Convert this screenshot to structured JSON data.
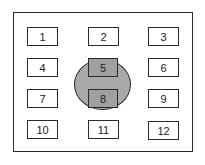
{
  "diagram": {
    "type": "grid-with-selection-ellipse",
    "rows": 4,
    "columns": 3,
    "cells": [
      {
        "label": "1",
        "row": 0,
        "col": 0,
        "highlighted": false
      },
      {
        "label": "2",
        "row": 0,
        "col": 1,
        "highlighted": false
      },
      {
        "label": "3",
        "row": 0,
        "col": 2,
        "highlighted": false
      },
      {
        "label": "4",
        "row": 1,
        "col": 0,
        "highlighted": false
      },
      {
        "label": "5",
        "row": 1,
        "col": 1,
        "highlighted": true
      },
      {
        "label": "6",
        "row": 1,
        "col": 2,
        "highlighted": false
      },
      {
        "label": "7",
        "row": 2,
        "col": 0,
        "highlighted": false
      },
      {
        "label": "8",
        "row": 2,
        "col": 1,
        "highlighted": true
      },
      {
        "label": "9",
        "row": 2,
        "col": 2,
        "highlighted": false
      },
      {
        "label": "10",
        "row": 3,
        "col": 0,
        "highlighted": false
      },
      {
        "label": "11",
        "row": 3,
        "col": 1,
        "highlighted": false
      },
      {
        "label": "12",
        "row": 3,
        "col": 2,
        "highlighted": false
      }
    ],
    "ellipse": {
      "covers": [
        "5",
        "8"
      ],
      "fill_color": "#a9a9a9"
    },
    "colors": {
      "stroke": "#2a2a2a",
      "cell_fill": "#ffffff",
      "highlight_fill": "#a0a0a0"
    }
  }
}
